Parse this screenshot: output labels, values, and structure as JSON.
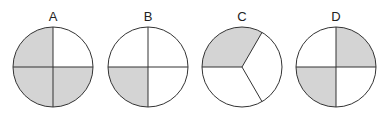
{
  "figure": {
    "colors": {
      "shade": "#d4d4d4",
      "stroke": "#333333",
      "background": "#ffffff"
    },
    "circles": [
      {
        "label": "A",
        "parts": 4,
        "shaded_parts": 3,
        "shaded": [
          "top-left",
          "bottom-left",
          "bottom-right"
        ]
      },
      {
        "label": "B",
        "parts": 4,
        "shaded_parts": 1,
        "shaded": [
          "bottom-left"
        ]
      },
      {
        "label": "C",
        "parts": 3,
        "shaded_parts": 1,
        "shaded": [
          "top-left sector"
        ]
      },
      {
        "label": "D",
        "parts": 4,
        "shaded_parts": 2,
        "shaded": [
          "top-right",
          "bottom-left"
        ]
      }
    ]
  }
}
